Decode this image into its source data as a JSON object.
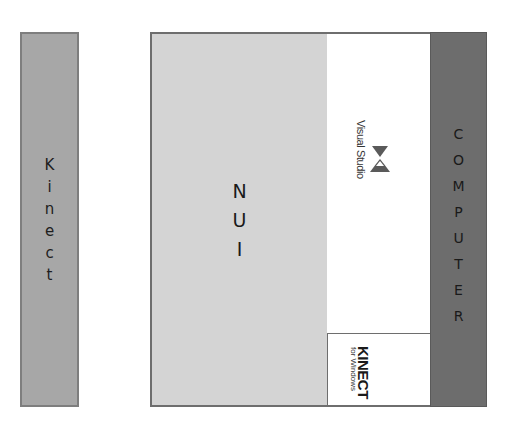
{
  "diagram": {
    "kinect": {
      "label": "Kinect",
      "letters": [
        "K",
        "i",
        "n",
        "e",
        "c",
        "t"
      ],
      "color": "#a7a7a7"
    },
    "nui": {
      "label": "NUI",
      "letters": [
        "N",
        "U",
        "I"
      ],
      "color": "#d4d4d4"
    },
    "visual_studio": {
      "label": "Visual Studio",
      "icon": "visual-studio-logo-icon",
      "color": "#ffffff"
    },
    "kinect_for_windows": {
      "title": "KINECT",
      "subtitle": "for Windows",
      "color": "#ffffff"
    },
    "computer": {
      "label": "COMPUTER",
      "letters": [
        "C",
        "O",
        "M",
        "P",
        "U",
        "T",
        "E",
        "R"
      ],
      "color": "#6d6d6d"
    }
  }
}
